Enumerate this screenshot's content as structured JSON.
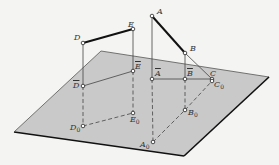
{
  "figure": {
    "colors": {
      "background": "#f4f4f2",
      "plane_fill": "#c9c9c9",
      "plane_edge_thin": "#555555",
      "plane_edge_thick": "#111111",
      "segment_thick": "#111111",
      "line_thin": "#444444",
      "point_fill": "#ffffff"
    },
    "plane": {
      "corners": [
        [
          101,
          51
        ],
        [
          269,
          77
        ],
        [
          184,
          156
        ],
        [
          14,
          132
        ]
      ]
    },
    "points": {
      "A": {
        "label": "A",
        "sub": "",
        "bar": false,
        "x": 152,
        "y": 16
      },
      "B": {
        "label": "B",
        "sub": "",
        "bar": false,
        "x": 185,
        "y": 53
      },
      "C": {
        "label": "C",
        "sub": "",
        "bar": false,
        "x": 212,
        "y": 79
      },
      "D": {
        "label": "D",
        "sub": "",
        "bar": false,
        "x": 83,
        "y": 43
      },
      "E": {
        "label": "E",
        "sub": "",
        "bar": false,
        "x": 133,
        "y": 29
      },
      "Abar": {
        "label": "A",
        "sub": "",
        "bar": true,
        "x": 152,
        "y": 79
      },
      "Bbar": {
        "label": "B",
        "sub": "",
        "bar": true,
        "x": 185,
        "y": 79
      },
      "Dbar": {
        "label": "D",
        "sub": "",
        "bar": true,
        "x": 83,
        "y": 86
      },
      "Ebar": {
        "label": "E",
        "sub": "",
        "bar": true,
        "x": 133,
        "y": 71
      },
      "A0": {
        "label": "A",
        "sub": "0",
        "bar": false,
        "x": 153,
        "y": 142
      },
      "B0": {
        "label": "B",
        "sub": "0",
        "bar": false,
        "x": 185,
        "y": 110
      },
      "C0": {
        "label": "C",
        "sub": "0",
        "bar": false,
        "x": 212,
        "y": 81
      },
      "D0": {
        "label": "D",
        "sub": "0",
        "bar": false,
        "x": 83,
        "y": 126
      },
      "E0": {
        "label": "E",
        "sub": "0",
        "bar": false,
        "x": 133,
        "y": 113
      }
    },
    "labels": [
      {
        "key": "A",
        "text": "A",
        "sub": "",
        "bar": false,
        "x": 157,
        "y": 8
      },
      {
        "key": "B",
        "text": "B",
        "sub": "",
        "bar": false,
        "x": 190,
        "y": 45
      },
      {
        "key": "C",
        "text": "C",
        "sub": "",
        "bar": false,
        "x": 210,
        "y": 70
      },
      {
        "key": "D",
        "text": "D",
        "sub": "",
        "bar": false,
        "x": 74,
        "y": 34
      },
      {
        "key": "E",
        "text": "E",
        "sub": "",
        "bar": false,
        "x": 128,
        "y": 21
      },
      {
        "key": "Abar",
        "text": "A",
        "sub": "",
        "bar": true,
        "x": 155,
        "y": 70
      },
      {
        "key": "Bbar",
        "text": "B",
        "sub": "",
        "bar": true,
        "x": 187,
        "y": 70
      },
      {
        "key": "Dbar",
        "text": "D",
        "sub": "",
        "bar": true,
        "x": 73,
        "y": 82
      },
      {
        "key": "Ebar",
        "text": "E",
        "sub": "",
        "bar": true,
        "x": 135,
        "y": 63
      },
      {
        "key": "A0",
        "text": "A",
        "sub": "0",
        "bar": false,
        "x": 140,
        "y": 141
      },
      {
        "key": "B0",
        "text": "B",
        "sub": "0",
        "bar": false,
        "x": 188,
        "y": 109
      },
      {
        "key": "C0",
        "text": "C",
        "sub": "0",
        "bar": false,
        "x": 214,
        "y": 81
      },
      {
        "key": "D0",
        "text": "D",
        "sub": "0",
        "bar": false,
        "x": 70,
        "y": 124
      },
      {
        "key": "E0",
        "text": "E",
        "sub": "0",
        "bar": false,
        "x": 130,
        "y": 116
      }
    ],
    "segments": {
      "thick": [
        [
          "D",
          "E"
        ],
        [
          "A",
          "B"
        ]
      ],
      "thin_solid": [
        [
          "B",
          "C"
        ],
        [
          "D",
          "Dbar"
        ],
        [
          "E",
          "Ebar"
        ],
        [
          "A",
          "Abar"
        ],
        [
          "B",
          "Bbar"
        ],
        [
          "Dbar",
          "Ebar"
        ],
        [
          "Abar",
          "Bbar"
        ],
        [
          "Bbar",
          "C"
        ]
      ],
      "dashed": [
        [
          "Dbar",
          "D0"
        ],
        [
          "Ebar",
          "E0"
        ],
        [
          "D0",
          "E0"
        ],
        [
          "Abar",
          "A0"
        ],
        [
          "Bbar",
          "B0"
        ],
        [
          "A0",
          "B0"
        ],
        [
          "B0",
          "C0"
        ]
      ]
    }
  }
}
